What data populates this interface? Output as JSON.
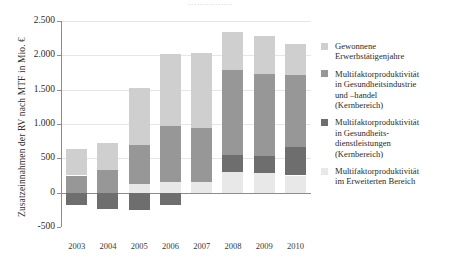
{
  "chart_data": {
    "type": "bar",
    "subtype": "stacked-bar-with-negative",
    "title": "",
    "xlabel": "",
    "ylabel": "Zusatzeinnahmen der RV nach MTF in Mio. €",
    "categories": [
      "2003",
      "2004",
      "2005",
      "2006",
      "2007",
      "2008",
      "2009",
      "2010"
    ],
    "ylim": [
      -500,
      2500
    ],
    "yticks": [
      -500,
      0,
      500,
      1000,
      1500,
      2000,
      2500
    ],
    "ytick_labels": [
      "-500",
      "0",
      "500",
      "1.000",
      "1.500",
      "2.000",
      "2.500"
    ],
    "grid": true,
    "grid_axis": "y",
    "legend_position": "right",
    "series": [
      {
        "name": "Multifaktorproduktivität im Erweiterten Bereich",
        "color": "#e8e8e8",
        "values": [
          0,
          0,
          120,
          150,
          150,
          300,
          290,
          250
        ]
      },
      {
        "name": "Multifaktorproduktivität in Gesundheitsdienstleistungen (Kernbereich)",
        "color": "#6e6e6e",
        "values": [
          -180,
          -240,
          -250,
          -180,
          0,
          250,
          250,
          420
        ]
      },
      {
        "name": "Multifaktorproduktivität in Gesundheitsindustrie und -handel (Kernbereich)",
        "color": "#979797",
        "values": [
          250,
          330,
          580,
          820,
          790,
          1240,
          1190,
          1040
        ]
      },
      {
        "name": "Gewonnene Erwerbstätigenjahre",
        "color": "#cfcfcf",
        "values": [
          385,
          390,
          830,
          1050,
          1090,
          545,
          545,
          460
        ]
      }
    ],
    "bar_totals": [
      635,
      720,
      1610,
      2020,
      2030,
      2335,
      2275,
      2170
    ]
  },
  "axis": {
    "y_title": "Zusatzeinnahmen der RV nach MTF in Mio. €",
    "y_ticks": [
      "2.500",
      "2.000",
      "1.500",
      "1.000",
      "500",
      "0",
      "-500"
    ],
    "x_ticks": [
      "2003",
      "2004",
      "2005",
      "2006",
      "2007",
      "2008",
      "2009",
      "2010"
    ]
  },
  "legend": {
    "items": [
      {
        "swatch_color": "#cfcfcf",
        "lines": [
          "Gewonnene",
          "Erwerbstätigenjahre"
        ]
      },
      {
        "swatch_color": "#979797",
        "lines": [
          "Multifaktorproduktivität",
          "in Gesundheitsindustrie",
          "und  –handel",
          "(Kernbereich)"
        ]
      },
      {
        "swatch_color": "#6e6e6e",
        "lines": [
          "Multifaktorproduktivität",
          "in Gesundheits-",
          "dienstleistungen",
          "(Kernbereich)"
        ]
      },
      {
        "swatch_color": "#e8e8e8",
        "lines": [
          "Multifaktorproduktivität",
          "im Erweiterten Bereich"
        ]
      }
    ]
  },
  "cutoff_title": {
    "text": "···············"
  }
}
